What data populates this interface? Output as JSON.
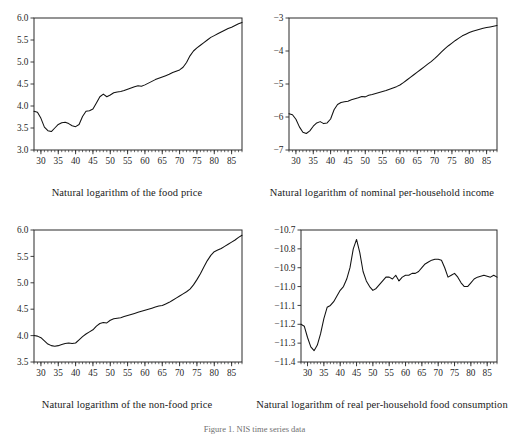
{
  "figure": {
    "caption": "Figure 1. NIS time series data",
    "background_color": "#ffffff",
    "line_color": "#111111",
    "axis_color": "#2a2a2a"
  },
  "chart_data": [
    {
      "id": "food-price",
      "type": "line",
      "title": "",
      "xlabel": "Natural logarithm of the food price",
      "ylabel": "",
      "xlim": [
        28,
        88
      ],
      "ylim": [
        3.0,
        6.0
      ],
      "xticks": [
        30,
        35,
        40,
        45,
        50,
        55,
        60,
        65,
        70,
        75,
        80,
        85
      ],
      "yticks": [
        "3.0",
        "3.5",
        "4.0",
        "4.5",
        "5.0",
        "5.5",
        "6.0"
      ],
      "ytick_values": [
        3.0,
        3.5,
        4.0,
        4.5,
        5.0,
        5.5,
        6.0
      ],
      "grid": false,
      "legend": "none",
      "x": [
        28,
        29,
        30,
        31,
        32,
        33,
        34,
        35,
        36,
        37,
        38,
        39,
        40,
        41,
        42,
        43,
        44,
        45,
        46,
        47,
        48,
        49,
        50,
        51,
        52,
        53,
        54,
        55,
        56,
        57,
        58,
        59,
        60,
        61,
        62,
        63,
        64,
        65,
        66,
        67,
        68,
        69,
        70,
        71,
        72,
        73,
        74,
        75,
        76,
        77,
        78,
        79,
        80,
        81,
        82,
        83,
        84,
        85,
        86,
        87,
        88
      ],
      "y": [
        3.88,
        3.86,
        3.72,
        3.52,
        3.44,
        3.42,
        3.5,
        3.58,
        3.62,
        3.63,
        3.6,
        3.55,
        3.53,
        3.58,
        3.76,
        3.88,
        3.89,
        3.93,
        4.07,
        4.21,
        4.27,
        4.21,
        4.25,
        4.3,
        4.32,
        4.33,
        4.35,
        4.38,
        4.41,
        4.44,
        4.46,
        4.45,
        4.48,
        4.52,
        4.56,
        4.6,
        4.63,
        4.66,
        4.69,
        4.72,
        4.76,
        4.79,
        4.82,
        4.88,
        4.99,
        5.14,
        5.25,
        5.32,
        5.38,
        5.44,
        5.5,
        5.56,
        5.6,
        5.64,
        5.68,
        5.72,
        5.76,
        5.79,
        5.83,
        5.87,
        5.9
      ]
    },
    {
      "id": "nominal-income",
      "type": "line",
      "title": "",
      "xlabel": "Natural logarithm of nominal per-household income",
      "ylabel": "",
      "xlim": [
        28,
        88
      ],
      "ylim": [
        -7,
        -3
      ],
      "xticks": [
        30,
        35,
        40,
        45,
        50,
        55,
        60,
        65,
        70,
        75,
        80,
        85
      ],
      "yticks": [
        "−7",
        "−6",
        "−5",
        "−4",
        "−3"
      ],
      "ytick_values": [
        -7,
        -6,
        -5,
        -4,
        -3
      ],
      "grid": false,
      "legend": "none",
      "x": [
        28,
        29,
        30,
        31,
        32,
        33,
        34,
        35,
        36,
        37,
        38,
        39,
        40,
        41,
        42,
        43,
        44,
        45,
        46,
        47,
        48,
        49,
        50,
        51,
        52,
        53,
        54,
        55,
        56,
        57,
        58,
        59,
        60,
        61,
        62,
        63,
        64,
        65,
        66,
        67,
        68,
        69,
        70,
        71,
        72,
        73,
        74,
        75,
        76,
        77,
        78,
        79,
        80,
        81,
        82,
        83,
        84,
        85,
        86,
        87,
        88
      ],
      "y": [
        -5.9,
        -5.93,
        -6.07,
        -6.3,
        -6.46,
        -6.5,
        -6.42,
        -6.28,
        -6.18,
        -6.14,
        -6.2,
        -6.18,
        -6.06,
        -5.78,
        -5.62,
        -5.56,
        -5.54,
        -5.52,
        -5.48,
        -5.45,
        -5.42,
        -5.38,
        -5.39,
        -5.34,
        -5.32,
        -5.29,
        -5.26,
        -5.23,
        -5.2,
        -5.16,
        -5.12,
        -5.08,
        -5.03,
        -4.96,
        -4.88,
        -4.8,
        -4.72,
        -4.64,
        -4.56,
        -4.48,
        -4.4,
        -4.32,
        -4.23,
        -4.13,
        -4.03,
        -3.93,
        -3.84,
        -3.76,
        -3.68,
        -3.61,
        -3.54,
        -3.49,
        -3.44,
        -3.4,
        -3.37,
        -3.34,
        -3.31,
        -3.29,
        -3.27,
        -3.25,
        -3.23
      ]
    },
    {
      "id": "nonfood-price",
      "type": "line",
      "title": "",
      "xlabel": "Natural logarithm of the non-food price",
      "ylabel": "",
      "xlim": [
        28,
        88
      ],
      "ylim": [
        3.5,
        6.0
      ],
      "xticks": [
        30,
        35,
        40,
        45,
        50,
        55,
        60,
        65,
        70,
        75,
        80,
        85
      ],
      "yticks": [
        "3.5",
        "4.0",
        "4.5",
        "5.0",
        "5.5",
        "6.0"
      ],
      "ytick_values": [
        3.5,
        4.0,
        4.5,
        5.0,
        5.5,
        6.0
      ],
      "grid": false,
      "legend": "none",
      "x": [
        28,
        29,
        30,
        31,
        32,
        33,
        34,
        35,
        36,
        37,
        38,
        39,
        40,
        41,
        42,
        43,
        44,
        45,
        46,
        47,
        48,
        49,
        50,
        51,
        52,
        53,
        54,
        55,
        56,
        57,
        58,
        59,
        60,
        61,
        62,
        63,
        64,
        65,
        66,
        67,
        68,
        69,
        70,
        71,
        72,
        73,
        74,
        75,
        76,
        77,
        78,
        79,
        80,
        81,
        82,
        83,
        84,
        85,
        86,
        87,
        88
      ],
      "y": [
        4.0,
        3.99,
        3.96,
        3.9,
        3.84,
        3.81,
        3.8,
        3.81,
        3.83,
        3.85,
        3.86,
        3.85,
        3.86,
        3.92,
        3.98,
        4.03,
        4.07,
        4.11,
        4.18,
        4.23,
        4.25,
        4.24,
        4.29,
        4.32,
        4.33,
        4.34,
        4.36,
        4.38,
        4.4,
        4.42,
        4.44,
        4.46,
        4.48,
        4.5,
        4.52,
        4.54,
        4.56,
        4.57,
        4.6,
        4.63,
        4.67,
        4.71,
        4.75,
        4.79,
        4.83,
        4.88,
        4.96,
        5.06,
        5.17,
        5.3,
        5.42,
        5.52,
        5.59,
        5.62,
        5.65,
        5.69,
        5.73,
        5.77,
        5.81,
        5.86,
        5.9
      ]
    },
    {
      "id": "food-consumption",
      "type": "line",
      "title": "",
      "xlabel": "Natural logarithm of  real per-household  food  consumption",
      "ylabel": "",
      "xlim": [
        28,
        88
      ],
      "ylim": [
        -11.4,
        -10.7
      ],
      "xticks": [
        30,
        35,
        40,
        45,
        50,
        55,
        60,
        65,
        70,
        75,
        80,
        85
      ],
      "yticks": [
        "−11.4",
        "−11.3",
        "−11.2",
        "−11.1",
        "−11.0",
        "−10.9",
        "−10.8",
        "−10.7"
      ],
      "ytick_values": [
        -11.4,
        -11.3,
        -11.2,
        -11.1,
        -11.0,
        -10.9,
        -10.8,
        -10.7
      ],
      "grid": false,
      "legend": "none",
      "x": [
        28,
        29,
        30,
        31,
        32,
        33,
        34,
        35,
        36,
        37,
        38,
        39,
        40,
        41,
        42,
        43,
        44,
        45,
        46,
        47,
        48,
        49,
        50,
        51,
        52,
        53,
        54,
        55,
        56,
        57,
        58,
        59,
        60,
        61,
        62,
        63,
        64,
        65,
        66,
        67,
        68,
        69,
        70,
        71,
        72,
        73,
        74,
        75,
        76,
        77,
        78,
        79,
        80,
        81,
        82,
        83,
        84,
        85,
        86,
        87,
        88
      ],
      "y": [
        -11.2,
        -11.21,
        -11.27,
        -11.32,
        -11.34,
        -11.31,
        -11.25,
        -11.17,
        -11.11,
        -11.1,
        -11.08,
        -11.05,
        -11.02,
        -11.0,
        -10.96,
        -10.9,
        -10.8,
        -10.75,
        -10.82,
        -10.92,
        -10.97,
        -11.0,
        -11.02,
        -11.01,
        -10.99,
        -10.97,
        -10.95,
        -10.95,
        -10.96,
        -10.94,
        -10.97,
        -10.95,
        -10.94,
        -10.94,
        -10.93,
        -10.93,
        -10.92,
        -10.9,
        -10.88,
        -10.87,
        -10.86,
        -10.855,
        -10.855,
        -10.86,
        -10.9,
        -10.95,
        -10.94,
        -10.93,
        -10.95,
        -10.98,
        -11.0,
        -11.0,
        -10.98,
        -10.96,
        -10.95,
        -10.945,
        -10.94,
        -10.945,
        -10.95,
        -10.94,
        -10.95
      ]
    }
  ]
}
